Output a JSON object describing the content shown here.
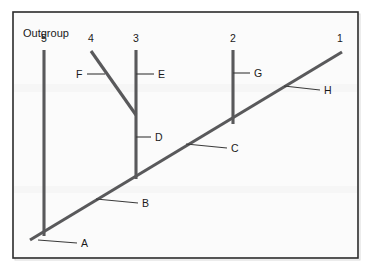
{
  "figure": {
    "type": "phylogenetic-cladogram",
    "background_color": "#ffffff",
    "panel_color": "#fbfbfb",
    "frame_color": "#2b2b2b",
    "branch_color": "#59595b",
    "leader_color": "#3a3a3a",
    "text_color": "#1a1a1a"
  },
  "annotations": {
    "outgroup_label": "Outgroup"
  },
  "tips": [
    {
      "id": "tip-5",
      "label": "5",
      "x": 44,
      "y": 42
    },
    {
      "id": "tip-4",
      "label": "4",
      "x": 91,
      "y": 42
    },
    {
      "id": "tip-3",
      "label": "3",
      "x": 136,
      "y": 42
    },
    {
      "id": "tip-2",
      "label": "2",
      "x": 233,
      "y": 42
    },
    {
      "id": "tip-1",
      "label": "1",
      "x": 340,
      "y": 42
    }
  ],
  "nodes": [
    {
      "id": "node-A",
      "label": "A",
      "label_x": 81,
      "label_y": 247,
      "leader_from_x": 38,
      "leader_from_y": 240,
      "leader_to_x": 77,
      "leader_to_y": 243
    },
    {
      "id": "node-B",
      "label": "B",
      "label_x": 142,
      "label_y": 207,
      "leader_from_x": 96,
      "leader_from_y": 199,
      "leader_to_x": 138,
      "leader_to_y": 203
    },
    {
      "id": "node-C",
      "label": "C",
      "label_x": 231,
      "label_y": 152,
      "leader_from_x": 186,
      "leader_from_y": 144,
      "leader_to_x": 227,
      "leader_to_y": 148
    },
    {
      "id": "node-D",
      "label": "D",
      "label_x": 155,
      "label_y": 141,
      "leader_from_x": 136,
      "leader_from_y": 137,
      "leader_to_x": 151,
      "leader_to_y": 137
    },
    {
      "id": "node-E",
      "label": "E",
      "label_x": 158,
      "label_y": 78,
      "leader_from_x": 136,
      "leader_from_y": 74,
      "leader_to_x": 154,
      "leader_to_y": 74
    },
    {
      "id": "node-F",
      "label": "F",
      "label_x": 76,
      "label_y": 78,
      "leader_from_x": 105,
      "leader_from_y": 74,
      "leader_to_x": 87,
      "leader_to_y": 74
    },
    {
      "id": "node-G",
      "label": "G",
      "label_x": 254,
      "label_y": 77,
      "leader_from_x": 233,
      "leader_from_y": 73,
      "leader_to_x": 250,
      "leader_to_y": 73
    },
    {
      "id": "node-H",
      "label": "H",
      "label_x": 324,
      "label_y": 94,
      "leader_from_x": 284,
      "leader_from_y": 86,
      "leader_to_x": 320,
      "leader_to_y": 90
    }
  ],
  "branches": [
    {
      "id": "branch-main-backbone",
      "from_x": 30,
      "from_y": 240,
      "to_x": 342,
      "to_y": 52
    },
    {
      "id": "branch-lineage-5",
      "from_x": 44,
      "from_y": 50,
      "to_x": 44,
      "to_y": 236
    },
    {
      "id": "branch-lineage-3",
      "from_x": 136,
      "from_y": 50,
      "to_x": 136,
      "to_y": 179
    },
    {
      "id": "branch-lineage-4",
      "from_x": 91,
      "from_y": 51,
      "to_x": 136,
      "to_y": 115
    },
    {
      "id": "branch-lineage-2",
      "from_x": 233,
      "from_y": 50,
      "to_x": 233,
      "to_y": 124
    }
  ],
  "frame": {
    "x": 13,
    "y": 12,
    "width": 345,
    "height": 246
  }
}
